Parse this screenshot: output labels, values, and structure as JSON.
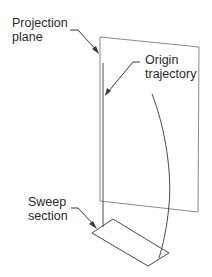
{
  "diagram": {
    "type": "sweep-projection-illustration",
    "labels": {
      "projection_plane": [
        "Projection",
        "plane"
      ],
      "origin_trajectory": [
        "Origin",
        "trajectory"
      ],
      "sweep_section": [
        "Sweep",
        "section"
      ]
    },
    "colors": {
      "plane_stroke": "#8a8a8a",
      "line_stroke": "#4a4a4a",
      "text": "#2a2a2a"
    }
  }
}
